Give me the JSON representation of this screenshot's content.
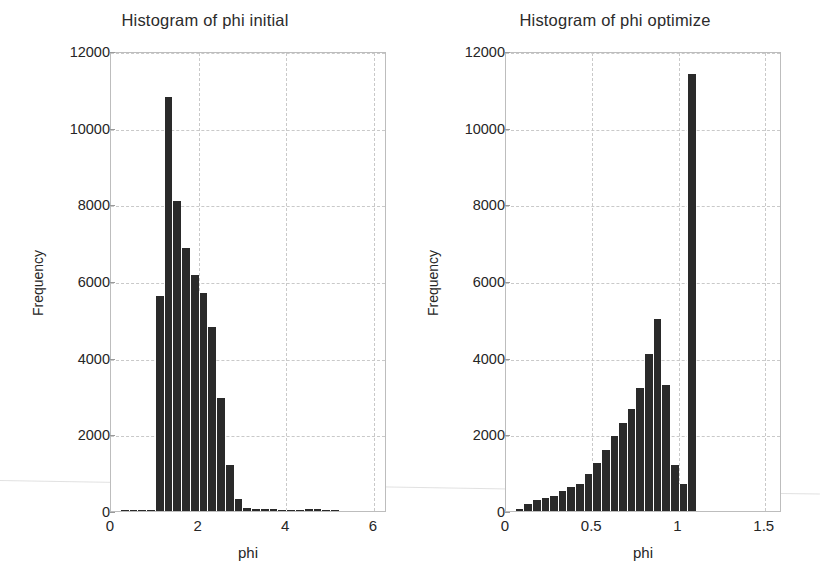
{
  "figure": {
    "background": "#ffffff",
    "bar_color": "#2a2a2a",
    "grid_color": "#c9c9c9",
    "axis_color": "#bdbdbd"
  },
  "chart_data": [
    {
      "type": "bar",
      "id": "phi-initial",
      "title": "Histogram of phi initial",
      "xlabel": "phi",
      "ylabel": "Frequency",
      "xlim": [
        0,
        6.3
      ],
      "ylim": [
        0,
        12000
      ],
      "grid": true,
      "legend": null,
      "xticks": [
        0,
        2,
        4,
        6
      ],
      "xticklabels": [
        "0",
        "2",
        "4",
        "6"
      ],
      "yticks": [
        0,
        2000,
        4000,
        6000,
        8000,
        10000,
        12000
      ],
      "yticklabels": [
        "0",
        "2000",
        "4000",
        "6000",
        "8000",
        "10000",
        "12000"
      ],
      "bin_width": 0.2,
      "bin_starts": [
        0.2,
        0.4,
        0.6,
        0.8,
        1.0,
        1.2,
        1.4,
        1.6,
        1.8,
        2.0,
        2.2,
        2.4,
        2.6,
        2.8,
        3.0,
        3.2,
        3.4,
        3.6,
        3.8,
        4.0,
        4.2,
        4.4,
        4.6,
        4.8,
        5.0
      ],
      "values": [
        10,
        15,
        20,
        25,
        5600,
        10800,
        8100,
        6850,
        6150,
        5700,
        4800,
        2950,
        1200,
        320,
        70,
        60,
        45,
        40,
        20,
        8,
        5,
        40,
        60,
        30,
        5
      ],
      "peak_value": 10800,
      "peak_bin": 1.2
    },
    {
      "type": "bar",
      "id": "phi-optimize",
      "title": "Histogram of phi optimize",
      "xlabel": "phi",
      "ylabel": "Frequency",
      "xlim": [
        0,
        1.6
      ],
      "ylim": [
        0,
        12000
      ],
      "grid": true,
      "legend": null,
      "xticks": [
        0,
        0.5,
        1,
        1.5
      ],
      "xticklabels": [
        "0",
        "0.5",
        "1",
        "1.5"
      ],
      "yticks": [
        0,
        2000,
        4000,
        6000,
        8000,
        10000,
        12000
      ],
      "yticklabels": [
        "0",
        "2000",
        "4000",
        "6000",
        "8000",
        "10000",
        "12000"
      ],
      "bin_width": 0.05,
      "bin_starts": [
        0.05,
        0.1,
        0.15,
        0.2,
        0.25,
        0.3,
        0.35,
        0.4,
        0.45,
        0.5,
        0.55,
        0.6,
        0.65,
        0.7,
        0.75,
        0.8,
        0.85,
        0.9,
        0.95,
        1.0,
        1.05
      ],
      "values": [
        60,
        180,
        280,
        330,
        400,
        520,
        620,
        700,
        960,
        1250,
        1600,
        1950,
        2300,
        2650,
        3200,
        4100,
        5000,
        3300,
        1200,
        700,
        11400
      ],
      "peak_value": 11400,
      "peak_bin": 1.05
    }
  ]
}
